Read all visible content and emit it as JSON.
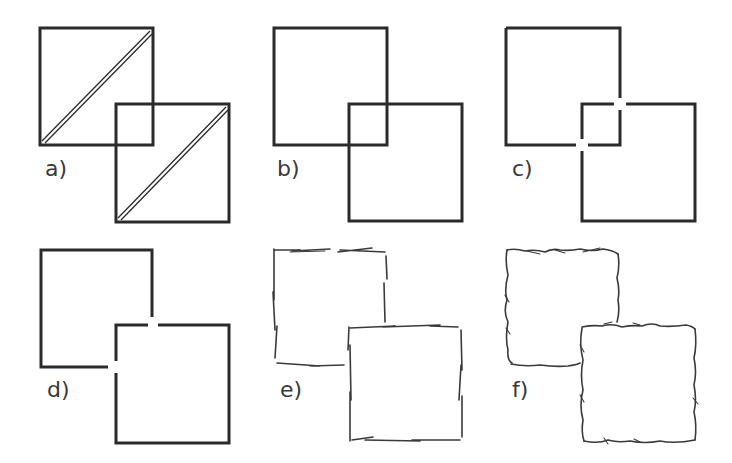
{
  "figure": {
    "panels": [
      {
        "id": "a",
        "label": "a)",
        "style": "solid outlines with double diagonal line, both squares fully visible"
      },
      {
        "id": "b",
        "label": "b)",
        "style": "solid outlines, both squares fully visible (transparent overlap)"
      },
      {
        "id": "c",
        "label": "c)",
        "style": "solid outlines with gaps at both intersection points"
      },
      {
        "id": "d",
        "label": "d)",
        "style": "solid outlines, front square occludes back square with gaps at crossings"
      },
      {
        "id": "e",
        "label": "e)",
        "style": "sketchy broken strokes, front square occludes back square"
      },
      {
        "id": "f",
        "label": "f)",
        "style": "wavy hand-drawn strokes, front square occludes back square"
      }
    ],
    "colors": {
      "stroke": "#2b2b2b",
      "background": "#ffffff"
    }
  }
}
